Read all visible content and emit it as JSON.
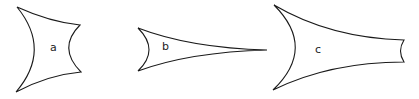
{
  "figure": {
    "shapes": [
      {
        "id": "a",
        "label": "a",
        "description": "concave quadrilateral with four curved sides"
      },
      {
        "id": "b",
        "label": "b",
        "description": "elongated concave triangle tapering to a point on the right"
      },
      {
        "id": "c",
        "label": "c",
        "description": "elongated concave shape with truncated concave right end"
      }
    ],
    "colors": {
      "stroke": "#1a1a1a",
      "fill": "#ffffff",
      "background": "#ffffff"
    }
  }
}
